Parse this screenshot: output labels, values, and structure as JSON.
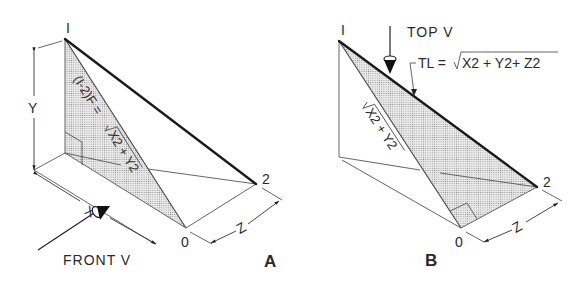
{
  "figures": [
    {
      "id": "A",
      "label": "A",
      "points": {
        "p1": "I",
        "p2": "2",
        "p0": "0"
      },
      "dimensions": {
        "x": "X",
        "y": "Y",
        "z": "Z"
      },
      "formula_prefix": "(I-2)F =",
      "formula_radicand": "X2 + Y2",
      "view_label": "FRONT V",
      "description": "Isometric view with front-view sight arrow; shaded right triangle between points I and 0 shows frontal length"
    },
    {
      "id": "B",
      "label": "B",
      "points": {
        "p1": "I",
        "p2": "2",
        "p0": "0"
      },
      "dimensions": {
        "z": "Z"
      },
      "diag_radicand": "X2 + Y2",
      "view_label": "TOP V",
      "tl_prefix": "TL =",
      "tl_radicand": "X2 + Y2+ Z2",
      "description": "Isometric view with top-view sight arrow; shaded right triangle I-0-2 shows true length"
    }
  ],
  "colors": {
    "line": "#444444",
    "heavy_line": "#1a1a1a",
    "shading": "#c8c8c8",
    "background": "#ffffff"
  }
}
